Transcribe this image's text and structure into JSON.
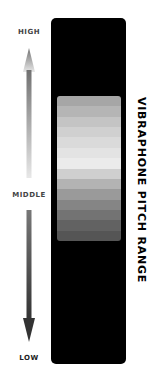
{
  "title": "VIBRAPHONE PITCH RANGE",
  "labels": {
    "high": "HIGH",
    "middle": "MIDDLE",
    "low": "LOW"
  },
  "colors": {
    "panel": "#000000",
    "arrow_up_top": "#707070",
    "arrow_up_bottom": "#e8e8e8",
    "arrow_down_top": "#777777",
    "arrow_down_bottom": "#333333"
  },
  "bands": [
    "#a6a6a6",
    "#b5b5b5",
    "#c4c4c4",
    "#d0d0d0",
    "#dadada",
    "#e3e3e3",
    "#ebebeb",
    "#cfcfcf",
    "#b3b3b3",
    "#9a9a9a",
    "#858585",
    "#737373",
    "#626262",
    "#555555"
  ]
}
